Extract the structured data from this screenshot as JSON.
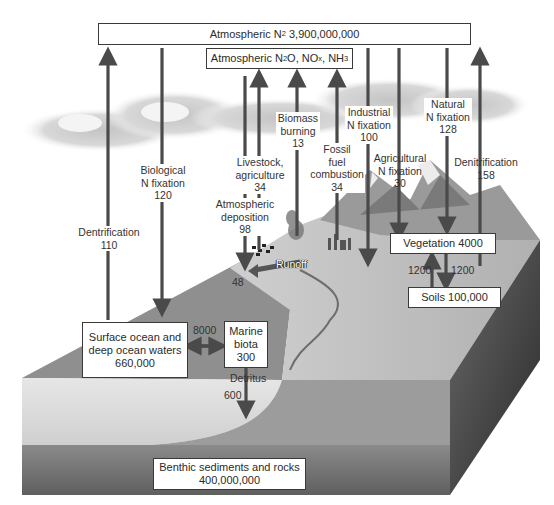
{
  "diagram": {
    "pools": {
      "atmospheric_n2": {
        "label_pre": "Atmospheric N",
        "label_sub": "2",
        "value": "3,900,000,000"
      },
      "atmospheric_n2o": {
        "label_a": "Atmospheric N",
        "sub1": "2",
        "label_b": "O, NO",
        "sub2": "x",
        "label_c": ", NH",
        "sub3": "3"
      },
      "vegetation": {
        "label": "Vegetation 4000"
      },
      "soils": {
        "label": "Soils 100,000"
      },
      "surface_ocean": {
        "line1": "Surface ocean and",
        "line2": "deep ocean waters",
        "value": "660,000"
      },
      "marine_biota": {
        "line1": "Marine",
        "line2": "biota",
        "value": "300"
      },
      "benthic": {
        "line1": "Benthic sediments and rocks",
        "value": "400,000,000"
      }
    },
    "fluxes": {
      "dentrification_ocean": {
        "line1": "Dentrification",
        "value": "110",
        "direction": "up"
      },
      "biological_fixation": {
        "line1": "Biological",
        "line2": "N fixation",
        "value": "120",
        "direction": "down"
      },
      "atmospheric_deposition": {
        "line1": "Atmospheric",
        "line2": "deposition",
        "value": "98",
        "direction": "down"
      },
      "livestock": {
        "line1": "Livestock,",
        "line2": "agriculture",
        "value": "34",
        "direction": "up"
      },
      "biomass_burning": {
        "line1": "Biomass",
        "line2": "burning",
        "value": "13",
        "direction": "up"
      },
      "fossil_fuel": {
        "line1": "Fossil",
        "line2": "fuel",
        "line3": "combustion",
        "value": "34",
        "direction": "up"
      },
      "industrial_fixation": {
        "line1": "Industrial",
        "line2": "N fixation",
        "value": "100",
        "direction": "down"
      },
      "agricultural_fixation": {
        "line1": "Agricultural",
        "line2": "N fixation",
        "value": "30",
        "direction": "down"
      },
      "natural_fixation": {
        "line1": "Natural",
        "line2": "N fixation",
        "value": "128",
        "direction": "down"
      },
      "denitrification_land": {
        "line1": "Denitrification",
        "value": "158",
        "direction": "up"
      },
      "runoff": {
        "label": "Runoff",
        "value": "48"
      },
      "veg_to_soil": {
        "value": "1200"
      },
      "soil_to_veg": {
        "value": "1200"
      },
      "ocean_biota_exchange": {
        "value": "8000"
      },
      "detritus": {
        "label": "Detritus",
        "value": "600"
      }
    },
    "colors": {
      "arrow": "#4a4a4a",
      "box_border": "#3a3a3a",
      "box_fill": "#ffffff",
      "ocean_surface": "#8f8f8f",
      "ocean_body": "#d9d9d9",
      "sediment": "#6e6e6e",
      "land": "#bdbdbd",
      "cliff_side": "#3d3d3d",
      "cloud": "#cfcfcf"
    }
  }
}
